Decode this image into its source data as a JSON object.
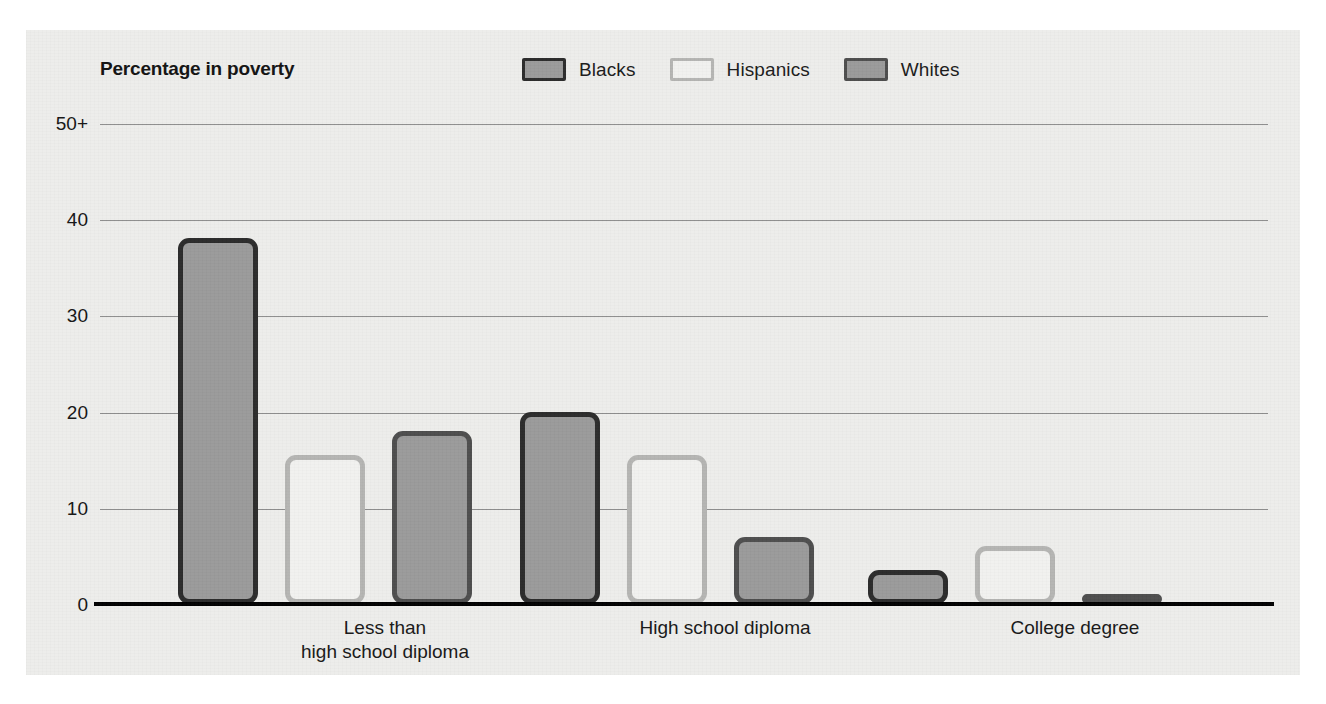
{
  "chart_data": {
    "type": "bar",
    "title": "Percentage in poverty",
    "xlabel": "",
    "ylabel": "Percentage in poverty",
    "ylim": [
      0,
      50
    ],
    "yticks": [
      0,
      10,
      20,
      30,
      40,
      50
    ],
    "ytick_labels": [
      "0",
      "10",
      "20",
      "30",
      "40",
      "50+"
    ],
    "grid": "horizontal",
    "legend_position": "top-right",
    "categories": [
      "Less than\nhigh school diploma",
      "High school diploma",
      "College degree"
    ],
    "series": [
      {
        "name": "Blacks",
        "values": [
          38,
          20,
          3.5
        ],
        "fill": "#9a9a9a",
        "border": "#2b2b2b"
      },
      {
        "name": "Hispanics",
        "values": [
          15.5,
          15.5,
          6
        ],
        "fill": "#f1f1ef",
        "border": "#b4b4b2"
      },
      {
        "name": "Whites",
        "values": [
          18,
          7,
          1
        ],
        "fill": "#9a9a9a",
        "border": "#4d4d4d"
      }
    ]
  },
  "figure": {
    "panel_bg": "#ededeb",
    "page_bg": "#ffffff",
    "gridline_color": "#8e8e8e",
    "baseline_color": "#000000",
    "text_color": "#141414"
  }
}
